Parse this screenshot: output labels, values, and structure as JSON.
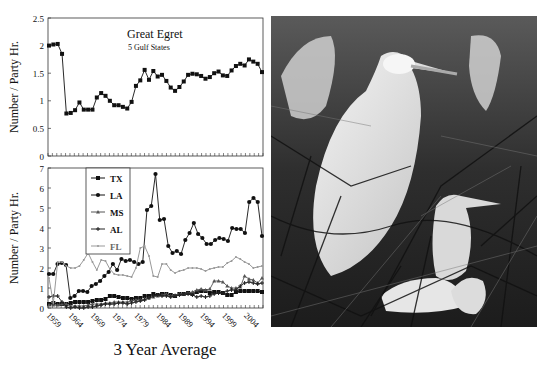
{
  "chart_data": [
    {
      "type": "line",
      "title": "Great Egret",
      "subtitle": "5 Gulf States",
      "xlabel": "3 Year Average",
      "ylabel": "Number / Party Hr.",
      "ylim": [
        0,
        2.5
      ],
      "yticks": [
        "0",
        "0.5",
        "1",
        "1.5",
        "2",
        "2.5"
      ],
      "x_start": 1959,
      "x_end": 2008,
      "grid": false,
      "series": [
        {
          "name": "5 Gulf States",
          "marker": "square",
          "color": "#111111",
          "values": [
            2.0,
            2.02,
            2.03,
            1.85,
            0.77,
            0.78,
            0.83,
            0.97,
            0.84,
            0.84,
            0.84,
            1.06,
            1.14,
            1.09,
            1.0,
            0.92,
            0.92,
            0.89,
            0.86,
            0.98,
            1.27,
            1.37,
            1.56,
            1.38,
            1.54,
            1.44,
            1.47,
            1.36,
            1.24,
            1.18,
            1.25,
            1.35,
            1.47,
            1.49,
            1.48,
            1.45,
            1.4,
            1.43,
            1.5,
            1.53,
            1.46,
            1.45,
            1.55,
            1.63,
            1.67,
            1.64,
            1.75,
            1.71,
            1.67,
            1.52
          ]
        }
      ]
    },
    {
      "type": "line",
      "title": "",
      "xlabel": "3 Year Average",
      "ylabel": "Number / Party Hr.",
      "ylim": [
        0,
        7
      ],
      "yticks": [
        "0",
        "1",
        "2",
        "3",
        "4",
        "5",
        "6",
        "7"
      ],
      "xticks": [
        "1959",
        "1964",
        "1969",
        "1974",
        "1979",
        "1984",
        "1989",
        "1994",
        "1999",
        "2004"
      ],
      "x_start": 1959,
      "x_end": 2008,
      "legend_position": "upper-left-inside",
      "grid": false,
      "series": [
        {
          "name": "TX",
          "marker": "square",
          "color": "#111111",
          "values": [
            0.2,
            0.25,
            0.2,
            0.2,
            0.2,
            0.25,
            0.3,
            0.3,
            0.3,
            0.3,
            0.35,
            0.4,
            0.4,
            0.45,
            0.6,
            0.6,
            0.55,
            0.5,
            0.5,
            0.45,
            0.5,
            0.5,
            0.6,
            0.6,
            0.7,
            0.65,
            0.7,
            0.7,
            0.65,
            0.6,
            0.7,
            0.7,
            0.75,
            0.7,
            0.8,
            0.85,
            0.85,
            0.75,
            0.8,
            0.8,
            0.75,
            0.65,
            0.65,
            0.8,
            0.85,
            0.85,
            0.85,
            0.85,
            0.85,
            0.8
          ]
        },
        {
          "name": "LA",
          "marker": "circle",
          "color": "#111111",
          "values": [
            1.7,
            1.7,
            2.2,
            2.25,
            2.15,
            0.5,
            0.6,
            0.85,
            0.85,
            0.8,
            1.1,
            1.2,
            1.35,
            1.6,
            1.8,
            2.2,
            1.9,
            2.45,
            2.35,
            2.4,
            2.3,
            2.2,
            2.3,
            4.9,
            5.1,
            6.7,
            4.4,
            4.45,
            3.1,
            2.75,
            2.85,
            2.7,
            3.4,
            3.75,
            4.25,
            3.7,
            3.5,
            3.2,
            3.2,
            3.4,
            3.5,
            3.45,
            3.35,
            4.0,
            3.95,
            3.95,
            3.75,
            5.3,
            5.5,
            5.3,
            3.6
          ]
        },
        {
          "name": "MS",
          "marker": "triangle",
          "color": "#555555",
          "values": [
            0.15,
            0.15,
            0.15,
            0.2,
            0.2,
            0.1,
            0.1,
            0.1,
            0.1,
            0.15,
            0.2,
            0.2,
            0.2,
            0.25,
            0.25,
            0.3,
            0.3,
            0.3,
            0.3,
            0.35,
            0.4,
            0.4,
            0.45,
            0.5,
            0.55,
            0.6,
            0.65,
            0.7,
            0.6,
            0.65,
            0.7,
            0.7,
            0.75,
            0.8,
            0.9,
            0.95,
            0.9,
            0.95,
            1.35,
            1.35,
            1.3,
            1.1,
            1.0,
            1.0,
            1.05,
            1.6,
            1.45,
            1.4,
            1.25,
            1.5
          ]
        },
        {
          "name": "AL",
          "marker": "plus",
          "color": "#222222",
          "values": [
            0.55,
            0.6,
            0.6,
            0.3,
            0.05,
            0.0,
            0.05,
            0.0,
            0.0,
            0.05,
            0.05,
            0.1,
            0.15,
            0.2,
            0.2,
            0.2,
            0.25,
            0.25,
            0.2,
            0.25,
            0.3,
            0.35,
            0.4,
            0.5,
            0.6,
            0.65,
            0.6,
            0.6,
            0.55,
            0.6,
            0.65,
            0.7,
            0.7,
            0.65,
            0.55,
            0.6,
            0.55,
            0.6,
            0.7,
            0.75,
            0.75,
            0.85,
            0.9,
            0.9,
            1.1,
            1.25,
            1.3,
            1.25,
            1.2,
            1.25
          ]
        },
        {
          "name": "FL",
          "marker": "dot",
          "color": "#999999",
          "values": [
            1.5,
            0.25,
            2.3,
            2.3,
            2.1,
            2.0,
            2.0,
            2.1,
            2.4,
            2.75,
            2.3,
            1.9,
            2.4,
            2.35,
            1.95,
            1.7,
            1.65,
            1.65,
            1.6,
            1.55,
            2.0,
            3.0,
            3.1,
            2.6,
            1.6,
            1.55,
            2.2,
            2.2,
            1.9,
            1.75,
            1.85,
            1.9,
            2.0,
            2.0,
            2.0,
            1.95,
            1.85,
            1.95,
            2.0,
            2.05,
            2.05,
            2.25,
            2.35,
            2.55,
            2.45,
            2.3,
            2.2,
            2.0,
            2.05,
            2.1
          ]
        }
      ]
    }
  ],
  "top_chart": {
    "title": "Great Egret",
    "subtitle": "5 Gulf States",
    "ylabel": "Number / Party Hr.",
    "yticks": [
      "0",
      "0.5",
      "1",
      "1.5",
      "2",
      "2.5"
    ]
  },
  "bottom_chart": {
    "ylabel": "Number / Party Hr.",
    "yticks": [
      "0",
      "1",
      "2",
      "3",
      "4",
      "5",
      "6",
      "7"
    ],
    "xticks": [
      "1959",
      "1964",
      "1969",
      "1974",
      "1979",
      "1984",
      "1989",
      "1994",
      "1999",
      "2004"
    ],
    "legend": [
      "TX",
      "LA",
      "MS",
      "AL",
      "FL"
    ]
  },
  "xlabel": "3 Year Average",
  "photo": {
    "subject": "Great Egret adult with chicks in nest",
    "style": "black-and-white photograph"
  }
}
